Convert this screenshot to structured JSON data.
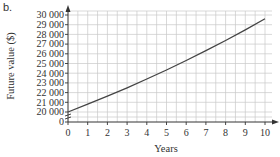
{
  "part_label": "b.",
  "chart_data": {
    "type": "line",
    "title": "",
    "xlabel": "Years",
    "ylabel": "Future value ($)",
    "x": [
      0,
      1,
      2,
      3,
      4,
      5,
      6,
      7,
      8,
      9,
      10
    ],
    "series": [
      {
        "name": "Future value",
        "values": [
          20000,
          20800,
          21632,
          22497,
          23397,
          24333,
          25306,
          26319,
          27371,
          28466,
          29605
        ]
      }
    ],
    "xlim": [
      0,
      10
    ],
    "ylim": [
      0,
      30000
    ],
    "y_axis_break": true,
    "x_ticks": [
      "0",
      "1",
      "2",
      "3",
      "4",
      "5",
      "6",
      "7",
      "8",
      "9",
      "10"
    ],
    "y_ticks": [
      "0",
      "20 000",
      "21 000",
      "22 000",
      "23 000",
      "24 000",
      "25 000",
      "26 000",
      "27 000",
      "28 000",
      "29 000",
      "30 000"
    ],
    "grid": true,
    "legend": "none",
    "line_color": "#444444",
    "grid_color": "#c8c8c8"
  }
}
